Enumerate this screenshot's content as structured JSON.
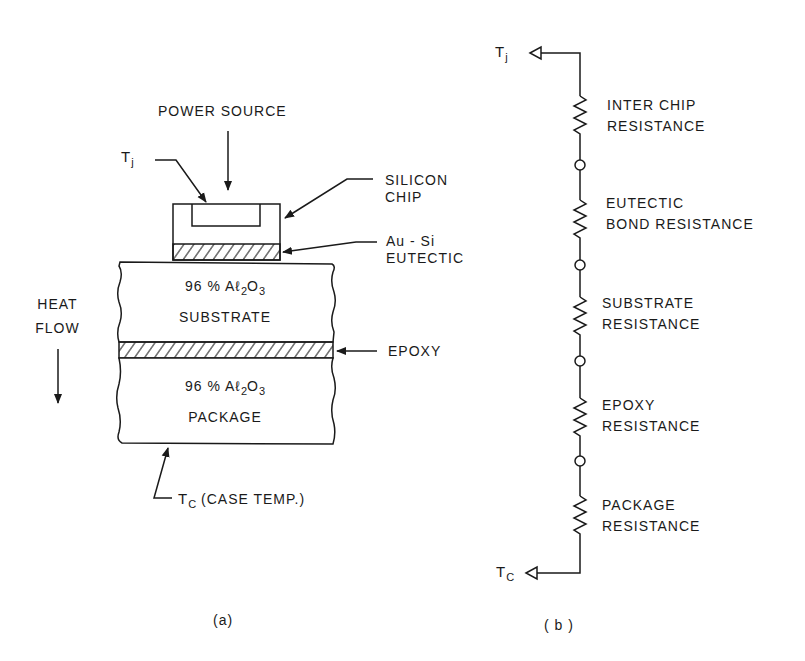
{
  "figure_a": {
    "caption": "(a)",
    "power_source": "POWER SOURCE",
    "tj_label": "T",
    "tj_sub": "j",
    "silicon_chip": [
      "SILICON",
      "CHIP"
    ],
    "au_si": [
      "Au - Si",
      "EUTECTIC"
    ],
    "substrate": {
      "line1_prefix": "96 % Aℓ",
      "line1_sub1": "2",
      "line1_mid": "O",
      "line1_sub2": "3",
      "line2": "SUBSTRATE"
    },
    "epoxy": "EPOXY",
    "package": {
      "line1_prefix": "96 % Aℓ",
      "line1_sub1": "2",
      "line1_mid": "O",
      "line1_sub2": "3",
      "line2": "PACKAGE"
    },
    "heat_flow": [
      "HEAT",
      "FLOW"
    ],
    "tc_label": "T",
    "tc_sub": "C",
    "tc_desc": "(CASE  TEMP.)"
  },
  "figure_b": {
    "caption": "( b )",
    "top_node": {
      "label": "T",
      "sub": "j"
    },
    "bottom_node": {
      "label": "T",
      "sub": "C"
    },
    "resistors": [
      {
        "line1": "INTER CHIP",
        "line2": "RESISTANCE"
      },
      {
        "line1": "EUTECTIC",
        "line2": "BOND RESISTANCE"
      },
      {
        "line1": "SUBSTRATE",
        "line2": "RESISTANCE"
      },
      {
        "line1": "EPOXY",
        "line2": "RESISTANCE"
      },
      {
        "line1": "PACKAGE",
        "line2": "RESISTANCE"
      }
    ]
  },
  "colors": {
    "ink": "#1a1a1a",
    "background": "#ffffff"
  }
}
